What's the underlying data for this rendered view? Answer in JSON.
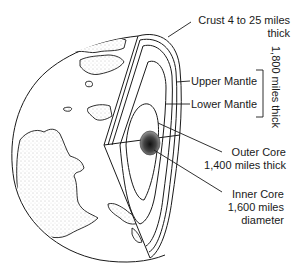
{
  "diagram": {
    "labels": {
      "crust_line1": "Crust  4 to 25 miles",
      "crust_line2": "thick",
      "upper_mantle": "Upper Mantle",
      "lower_mantle": "Lower Mantle",
      "mantle_thickness": "1,800 miles thick",
      "outer_core_line1": "Outer Core",
      "outer_core_line2": "1,400 miles thick",
      "inner_core_line1": "Inner Core",
      "inner_core_line2": "1,600 miles",
      "inner_core_line3": "diameter"
    },
    "layers": [
      {
        "name": "Crust",
        "thickness": "4 to 25 miles"
      },
      {
        "name": "Upper Mantle"
      },
      {
        "name": "Lower Mantle"
      },
      {
        "name": "Mantle (total)",
        "thickness": "1,800 miles"
      },
      {
        "name": "Outer Core",
        "thickness": "1,400 miles"
      },
      {
        "name": "Inner Core",
        "diameter": "1,600 miles"
      }
    ],
    "colors": {
      "line": "#1a1a1a",
      "background": "#ffffff",
      "land_stipple": "#9a9a9a",
      "core_dark": "#222222"
    }
  }
}
